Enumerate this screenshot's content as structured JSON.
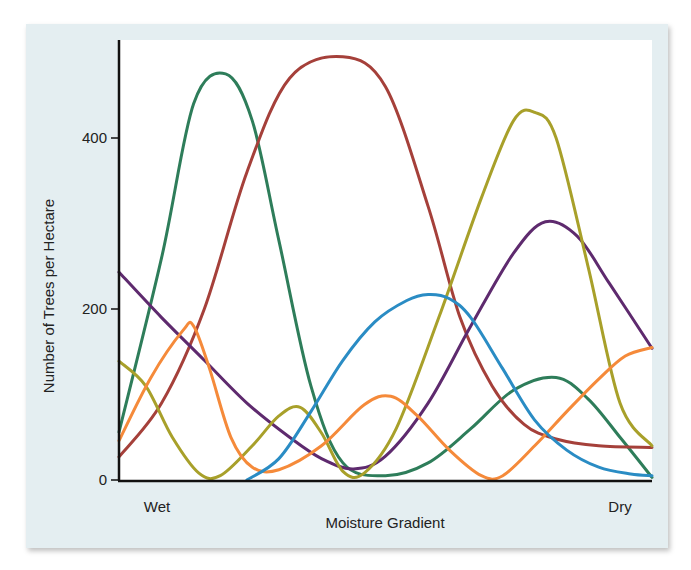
{
  "chart_data": {
    "type": "line",
    "title": "",
    "xlabel": "Moisture Gradient",
    "ylabel": "Number of Trees per Hectare",
    "x_tick_labels": [
      "Wet",
      "Dry"
    ],
    "y_ticks": [
      0,
      200,
      400
    ],
    "ylim": [
      0,
      500
    ],
    "xlim": [
      0,
      100
    ],
    "grid": false,
    "legend": null,
    "series": [
      {
        "name": "green",
        "color": "#2e7d5a",
        "points": [
          [
            0,
            56
          ],
          [
            8,
            260
          ],
          [
            14,
            440
          ],
          [
            20,
            475
          ],
          [
            25,
            420
          ],
          [
            30,
            280
          ],
          [
            36,
            110
          ],
          [
            42,
            20
          ],
          [
            50,
            5
          ],
          [
            58,
            20
          ],
          [
            66,
            60
          ],
          [
            74,
            105
          ],
          [
            82,
            120
          ],
          [
            88,
            95
          ],
          [
            94,
            50
          ],
          [
            100,
            3
          ]
        ]
      },
      {
        "name": "red-brown",
        "color": "#a5403a",
        "points": [
          [
            0,
            27
          ],
          [
            8,
            90
          ],
          [
            16,
            200
          ],
          [
            24,
            360
          ],
          [
            32,
            470
          ],
          [
            42,
            495
          ],
          [
            50,
            460
          ],
          [
            58,
            320
          ],
          [
            64,
            190
          ],
          [
            70,
            110
          ],
          [
            76,
            65
          ],
          [
            82,
            48
          ],
          [
            90,
            40
          ],
          [
            100,
            38
          ]
        ]
      },
      {
        "name": "purple",
        "color": "#5e2a6e",
        "points": [
          [
            0,
            243
          ],
          [
            8,
            190
          ],
          [
            16,
            140
          ],
          [
            24,
            90
          ],
          [
            32,
            50
          ],
          [
            38,
            25
          ],
          [
            44,
            13
          ],
          [
            50,
            28
          ],
          [
            58,
            90
          ],
          [
            66,
            180
          ],
          [
            74,
            265
          ],
          [
            80,
            302
          ],
          [
            86,
            285
          ],
          [
            92,
            230
          ],
          [
            100,
            154
          ]
        ]
      },
      {
        "name": "olive",
        "color": "#a8a02a",
        "points": [
          [
            0,
            139
          ],
          [
            5,
            110
          ],
          [
            10,
            50
          ],
          [
            15,
            8
          ],
          [
            19,
            5
          ],
          [
            25,
            40
          ],
          [
            30,
            75
          ],
          [
            34,
            85
          ],
          [
            38,
            55
          ],
          [
            42,
            10
          ],
          [
            46,
            8
          ],
          [
            52,
            60
          ],
          [
            60,
            190
          ],
          [
            68,
            330
          ],
          [
            74,
            420
          ],
          [
            78,
            430
          ],
          [
            82,
            400
          ],
          [
            88,
            250
          ],
          [
            94,
            90
          ],
          [
            100,
            40
          ]
        ]
      },
      {
        "name": "orange",
        "color": "#f58a3a",
        "points": [
          [
            0,
            46
          ],
          [
            6,
            120
          ],
          [
            12,
            175
          ],
          [
            14,
            180
          ],
          [
            17,
            130
          ],
          [
            21,
            50
          ],
          [
            25,
            15
          ],
          [
            30,
            12
          ],
          [
            38,
            40
          ],
          [
            46,
            88
          ],
          [
            51,
            98
          ],
          [
            56,
            75
          ],
          [
            62,
            35
          ],
          [
            68,
            5
          ],
          [
            72,
            5
          ],
          [
            78,
            40
          ],
          [
            84,
            80
          ],
          [
            90,
            118
          ],
          [
            95,
            145
          ],
          [
            100,
            155
          ]
        ]
      },
      {
        "name": "blue",
        "color": "#2a8cc4",
        "points": [
          [
            24,
            0
          ],
          [
            30,
            25
          ],
          [
            36,
            80
          ],
          [
            42,
            140
          ],
          [
            48,
            185
          ],
          [
            54,
            210
          ],
          [
            58,
            217
          ],
          [
            62,
            212
          ],
          [
            66,
            190
          ],
          [
            72,
            130
          ],
          [
            78,
            70
          ],
          [
            84,
            35
          ],
          [
            90,
            15
          ],
          [
            96,
            7
          ],
          [
            100,
            5
          ]
        ]
      }
    ]
  }
}
